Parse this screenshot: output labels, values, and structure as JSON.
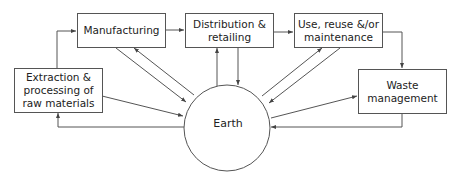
{
  "diagram": {
    "nodes": [
      {
        "id": "extraction",
        "label": "Extraction &\nprocessing of\nraw materials"
      },
      {
        "id": "manufacturing",
        "label": "Manufacturing"
      },
      {
        "id": "distribution",
        "label": "Distribution &\nretailing"
      },
      {
        "id": "use",
        "label": "Use, reuse &/or\nmaintenance"
      },
      {
        "id": "waste",
        "label": "Waste\nmanagement"
      },
      {
        "id": "earth",
        "label": "Earth"
      }
    ],
    "edges": [
      {
        "from": "extraction",
        "to": "manufacturing"
      },
      {
        "from": "manufacturing",
        "to": "distribution"
      },
      {
        "from": "distribution",
        "to": "use"
      },
      {
        "from": "use",
        "to": "waste"
      },
      {
        "from": "extraction",
        "to": "earth"
      },
      {
        "from": "earth",
        "to": "extraction"
      },
      {
        "from": "manufacturing",
        "to": "earth"
      },
      {
        "from": "earth",
        "to": "manufacturing"
      },
      {
        "from": "distribution",
        "to": "earth"
      },
      {
        "from": "earth",
        "to": "distribution"
      },
      {
        "from": "use",
        "to": "earth"
      },
      {
        "from": "earth",
        "to": "use"
      },
      {
        "from": "waste",
        "to": "earth"
      },
      {
        "from": "earth",
        "to": "waste"
      }
    ],
    "colors": {
      "stroke": "#555555",
      "text": "#222222",
      "background": "#ffffff"
    }
  }
}
